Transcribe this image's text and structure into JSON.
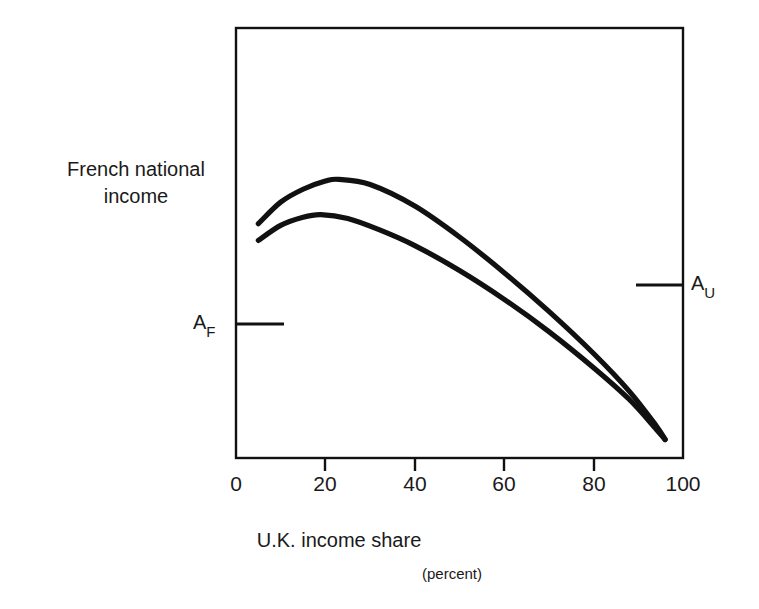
{
  "figure": {
    "background_color": "#ffffff",
    "line_color": "#111111"
  },
  "axes": {
    "y_title_line1": "French national",
    "y_title_line2": "income",
    "y_title": "French national income",
    "x_title": "U.K. income share",
    "x_subtitle": "(percent)",
    "x_ticks": [
      {
        "value": 0,
        "label": "0",
        "px": 236
      },
      {
        "value": 20,
        "label": "20",
        "px": 325
      },
      {
        "value": 40,
        "label": "40",
        "px": 415
      },
      {
        "value": 60,
        "label": "60",
        "px": 504
      },
      {
        "value": 80,
        "label": "80",
        "px": 594
      },
      {
        "value": 100,
        "label": "100",
        "px": 683
      }
    ]
  },
  "markers": {
    "af": {
      "base": "A",
      "subscript": "F",
      "side": "left",
      "y_px": 324
    },
    "au": {
      "base": "A",
      "subscript": "U",
      "side": "right",
      "y_px": 285
    }
  },
  "chart_data": {
    "type": "line",
    "title": "",
    "xlabel": "U.K. income share (percent)",
    "ylabel": "French national income",
    "xlim": [
      0,
      100
    ],
    "ylim": [
      0,
      1
    ],
    "grid": false,
    "legend": false,
    "annotations": [
      {
        "text": "A_F",
        "axis": "y-left",
        "note": "French autarky income level tick on left axis"
      },
      {
        "text": "A_U",
        "axis": "y-right",
        "note": "U.K. related income level tick on right axis"
      }
    ],
    "series": [
      {
        "name": "upper curve",
        "x": [
          5,
          10,
          15,
          20,
          23,
          30,
          40,
          50,
          60,
          70,
          80,
          88,
          94,
          96
        ],
        "y": [
          0.545,
          0.595,
          0.625,
          0.644,
          0.648,
          0.636,
          0.586,
          0.514,
          0.431,
          0.341,
          0.243,
          0.155,
          0.075,
          0.043
        ]
      },
      {
        "name": "lower curve",
        "x": [
          5,
          10,
          15,
          19,
          25,
          32,
          40,
          50,
          60,
          70,
          80,
          88,
          94,
          96
        ],
        "y": [
          0.506,
          0.541,
          0.56,
          0.566,
          0.557,
          0.531,
          0.494,
          0.436,
          0.369,
          0.294,
          0.21,
          0.136,
          0.067,
          0.043
        ]
      }
    ]
  }
}
